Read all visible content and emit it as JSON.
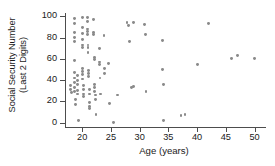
{
  "chart_data": {
    "type": "scatter",
    "title": "",
    "xlabel": "Age (years)",
    "ylabel_line1": "Social Security Number",
    "ylabel_line2": "(Last 2 Digits)",
    "xlim": [
      17,
      52
    ],
    "ylim": [
      -4,
      103
    ],
    "xticks": [
      20,
      25,
      30,
      35,
      40,
      45,
      50
    ],
    "yticks": [
      0,
      20,
      40,
      60,
      80,
      100
    ],
    "xtick_labels": [
      "20",
      "25",
      "30",
      "35",
      "40",
      "45",
      "50"
    ],
    "ytick_labels": [
      "0",
      "20",
      "40",
      "60",
      "80",
      "100"
    ],
    "grid": false,
    "legend": false,
    "marker_color": "#8a8a8a",
    "axis_color": "#4d4d4d",
    "background": "#ffffff",
    "points": [
      [
        18.0,
        35
      ],
      [
        18.0,
        31
      ],
      [
        18.1,
        28
      ],
      [
        18.6,
        98
      ],
      [
        18.6,
        93
      ],
      [
        18.6,
        85
      ],
      [
        18.6,
        80
      ],
      [
        18.6,
        76
      ],
      [
        18.7,
        58
      ],
      [
        18.7,
        47
      ],
      [
        18.7,
        42
      ],
      [
        18.7,
        38
      ],
      [
        18.7,
        33
      ],
      [
        18.7,
        29
      ],
      [
        18.8,
        22
      ],
      [
        18.9,
        17
      ],
      [
        19.2,
        44
      ],
      [
        19.2,
        40
      ],
      [
        19.2,
        36
      ],
      [
        19.2,
        30
      ],
      [
        19.2,
        27
      ],
      [
        19.4,
        2
      ],
      [
        20.0,
        99
      ],
      [
        20.0,
        89
      ],
      [
        20.0,
        84
      ],
      [
        20.0,
        78
      ],
      [
        20.0,
        73
      ],
      [
        20.0,
        71
      ],
      [
        20.1,
        51
      ],
      [
        20.1,
        48
      ],
      [
        20.1,
        45
      ],
      [
        20.1,
        41
      ],
      [
        20.2,
        35
      ],
      [
        20.2,
        31
      ],
      [
        20.2,
        27
      ],
      [
        20.2,
        25
      ],
      [
        20.9,
        99
      ],
      [
        20.9,
        95
      ],
      [
        20.9,
        88
      ],
      [
        20.9,
        86
      ],
      [
        20.9,
        83
      ],
      [
        21.0,
        73
      ],
      [
        21.0,
        71
      ],
      [
        21.0,
        66
      ],
      [
        21.1,
        49
      ],
      [
        21.1,
        46
      ],
      [
        21.1,
        43
      ],
      [
        21.2,
        31
      ],
      [
        21.2,
        27
      ],
      [
        21.2,
        19
      ],
      [
        21.2,
        15
      ],
      [
        21.2,
        13
      ],
      [
        22.0,
        97
      ],
      [
        22.0,
        85
      ],
      [
        22.0,
        83
      ],
      [
        22.1,
        61
      ],
      [
        22.1,
        59
      ],
      [
        22.2,
        36
      ],
      [
        22.2,
        33
      ],
      [
        22.2,
        29
      ],
      [
        22.3,
        26
      ],
      [
        22.3,
        22
      ],
      [
        22.4,
        8
      ],
      [
        23.0,
        70
      ],
      [
        23.0,
        57
      ],
      [
        23.0,
        55
      ],
      [
        23.1,
        42
      ],
      [
        23.2,
        27
      ],
      [
        23.8,
        82
      ],
      [
        23.9,
        51
      ],
      [
        23.9,
        46
      ],
      [
        24.6,
        56
      ],
      [
        24.7,
        18
      ],
      [
        25.5,
        0
      ],
      [
        26.2,
        26
      ],
      [
        27.8,
        94
      ],
      [
        28.0,
        91
      ],
      [
        28.2,
        76
      ],
      [
        28.6,
        33
      ],
      [
        28.9,
        94
      ],
      [
        29.0,
        34
      ],
      [
        30.8,
        92
      ],
      [
        31.0,
        83
      ],
      [
        31.1,
        29
      ],
      [
        34.0,
        77
      ],
      [
        34.0,
        50
      ],
      [
        34.1,
        36
      ],
      [
        34.2,
        2
      ],
      [
        37.2,
        7
      ],
      [
        37.9,
        8
      ],
      [
        40.0,
        55
      ],
      [
        42.0,
        93
      ],
      [
        46.0,
        60
      ],
      [
        47.0,
        63
      ],
      [
        50.0,
        60
      ]
    ]
  }
}
